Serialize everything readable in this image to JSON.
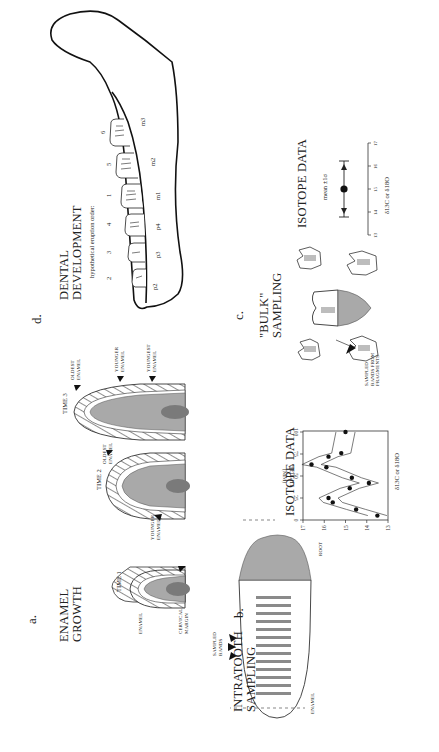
{
  "figure": {
    "panels": {
      "a": {
        "label": "a.",
        "title_line1": "ENAMEL",
        "title_line2": "GROWTH",
        "stages": [
          {
            "label": "TIME 1"
          },
          {
            "label": "TIME 2"
          },
          {
            "label": "TIME 3"
          }
        ],
        "annotations": {
          "enamel": "ENAMEL",
          "cervical_margin_1": "CERVICAL",
          "cervical_margin_2": "MARGIN",
          "younger_enamel_1": "YOUNGER",
          "younger_enamel_2": "ENAMEL",
          "oldest_enamel_1": "OLDEST",
          "oldest_enamel_2": "ENAMEL",
          "t3_oldest_1": "OLDEST",
          "t3_oldest_2": "ENAMEL",
          "t3_younger_1": "YOUNGER",
          "t3_younger_2": "ENAMEL",
          "t3_youngest_1": "YOUNGEST",
          "t3_youngest_2": "ENAMEL"
        }
      },
      "b": {
        "label": "b.",
        "title_line1": "INTRATOOTH",
        "title_line2": "SAMPLING",
        "enamel_label": "ENAMEL",
        "root_label": "ROOT",
        "sampled_bands_1": "SAMPLED",
        "sampled_bands_2": "BANDS",
        "chart_title": "ISOTOPE DATA",
        "y_label_1": "HEIGHT",
        "y_label_2": "(MM)",
        "x_label": "δ13C or δ18O"
      },
      "c": {
        "label": "c.",
        "title_line1": "\"BULK\"",
        "title_line2": "SAMPLING",
        "fragments_label_1": "SAMPLED",
        "fragments_label_2": "BANDS FROM",
        "fragments_label_3": "FRAGMENTS",
        "chart_title": "ISOTOPE DATA",
        "stat_label": "mean ±1σ",
        "x_label": "δ13C or δ18O"
      },
      "d": {
        "label": "d.",
        "title_line1": "DENTAL",
        "title_line2": "DEVELOPMENT",
        "eruption_label": "hypothetical eruption order:",
        "teeth": [
          {
            "name": "p2",
            "order": "2"
          },
          {
            "name": "p3",
            "order": "3"
          },
          {
            "name": "p4",
            "order": "4"
          },
          {
            "name": "m1",
            "order": "1"
          },
          {
            "name": "m2",
            "order": "5"
          },
          {
            "name": "m3",
            "order": "6"
          }
        ]
      }
    }
  },
  "chart_data": [
    {
      "type": "scatter",
      "title": "ISOTOPE DATA",
      "panel": "b",
      "xlabel": "δ13C or δ18O",
      "ylabel": "HEIGHT (MM)",
      "xlim": [
        13,
        17
      ],
      "ylim": [
        0,
        100
      ],
      "xticks": [
        13,
        14,
        15,
        16,
        17
      ],
      "yticks": [
        0,
        25,
        50,
        75,
        100
      ],
      "grid": false,
      "series": [
        {
          "name": "intratooth samples",
          "points": [
            {
              "x": 15.0,
              "y": 100
            },
            {
              "x": 15.2,
              "y": 76
            },
            {
              "x": 15.8,
              "y": 72
            },
            {
              "x": 16.6,
              "y": 63
            },
            {
              "x": 15.9,
              "y": 60
            },
            {
              "x": 14.7,
              "y": 48
            },
            {
              "x": 13.9,
              "y": 42
            },
            {
              "x": 14.8,
              "y": 36
            },
            {
              "x": 15.8,
              "y": 25
            },
            {
              "x": 15.6,
              "y": 20
            },
            {
              "x": 14.5,
              "y": 12
            },
            {
              "x": 13.5,
              "y": 5
            }
          ]
        }
      ],
      "envelope": "band enclosing points (error envelope)"
    },
    {
      "type": "scatter",
      "title": "ISOTOPE DATA",
      "panel": "c",
      "xlabel": "δ13C or δ18O",
      "xlim": [
        13,
        17
      ],
      "xticks": [
        13,
        14,
        15,
        16,
        17
      ],
      "annotation": "mean ±1σ",
      "series": [
        {
          "name": "bulk mean",
          "points": [
            {
              "x": 15.0,
              "mean": 15.0,
              "sd_low": 13.8,
              "sd_high": 16.2
            }
          ]
        }
      ]
    }
  ]
}
